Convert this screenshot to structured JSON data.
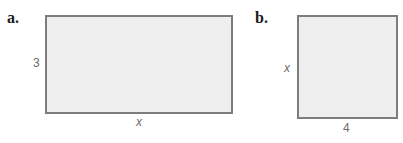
{
  "figures": [
    {
      "label": "a.",
      "shape": "rectangle",
      "height_label": "3",
      "width_label": "x"
    },
    {
      "label": "b.",
      "shape": "rectangle",
      "height_label": "x",
      "width_label": "4"
    }
  ],
  "colors": {
    "fill": "#efefef",
    "border": "#7d7d7d",
    "dimension_text": "#6b6b6b"
  }
}
